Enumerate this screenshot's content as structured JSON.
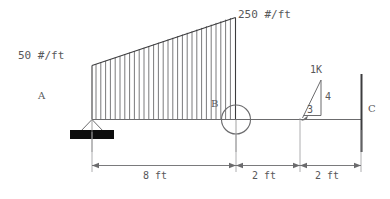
{
  "diagram": {
    "labels": {
      "load_left": "50 #/ft",
      "load_right": "250 #/ft",
      "point_a": "A",
      "point_b": "B",
      "point_c": "C",
      "force_label": "1K",
      "slope_vertical": "4",
      "slope_horizontal": "3"
    },
    "dimensions": [
      {
        "name": "span-ab",
        "text": "8 ft"
      },
      {
        "name": "span-bp",
        "text": "2 ft"
      },
      {
        "name": "span-pc",
        "text": "2 ft"
      }
    ],
    "colors": {
      "line": "#58585a",
      "hatch": "#6b6b6d",
      "fill": "#000000",
      "background": "#ffffff"
    }
  }
}
